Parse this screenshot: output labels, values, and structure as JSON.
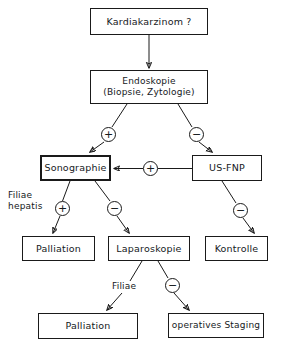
{
  "diagram": {
    "language": "de",
    "stroke_color": "#1a1a1a",
    "background_color": "#ffffff",
    "nodes": [
      {
        "id": "kardiakarzinom",
        "label": "Kardiakarzinom ?",
        "lines": [
          "Kardiakarzinom ?"
        ],
        "x": 90,
        "y": 8,
        "w": 118,
        "h": 27,
        "font_size": 9.5,
        "emphasis": "normal"
      },
      {
        "id": "endoskopie",
        "label": "Endoskopie (Biopsie, Zytologie)",
        "lines": [
          "Endoskopie",
          "(Biopsie, Zytologie)"
        ],
        "x": 90,
        "y": 70,
        "w": 118,
        "h": 34,
        "font_size": 9,
        "emphasis": "normal"
      },
      {
        "id": "sonographie",
        "label": "Sonographie",
        "lines": [
          "Sonographie"
        ],
        "x": 40,
        "y": 155,
        "w": 71,
        "h": 26,
        "font_size": 9.5,
        "emphasis": "thick"
      },
      {
        "id": "usfnp",
        "label": "US-FNP",
        "lines": [
          "US-FNP"
        ],
        "x": 192,
        "y": 155,
        "w": 70,
        "h": 26,
        "font_size": 9.5,
        "emphasis": "normal"
      },
      {
        "id": "palliation_1",
        "label": "Palliation",
        "lines": [
          "Palliation"
        ],
        "x": 22,
        "y": 236,
        "w": 73,
        "h": 25,
        "font_size": 9.5,
        "emphasis": "normal"
      },
      {
        "id": "laparoskopie",
        "label": "Laparoskopie",
        "lines": [
          "Laparoskopie"
        ],
        "x": 108,
        "y": 236,
        "w": 82,
        "h": 25,
        "font_size": 9.5,
        "emphasis": "normal"
      },
      {
        "id": "kontrolle",
        "label": "Kontrolle",
        "lines": [
          "Kontrolle"
        ],
        "x": 205,
        "y": 236,
        "w": 63,
        "h": 25,
        "font_size": 9.5,
        "emphasis": "normal"
      },
      {
        "id": "palliation_2",
        "label": "Palliation",
        "lines": [
          "Palliation"
        ],
        "x": 38,
        "y": 313,
        "w": 100,
        "h": 26,
        "font_size": 9.5,
        "emphasis": "normal"
      },
      {
        "id": "operatives_staging",
        "label": "operatives Staging",
        "lines": [
          "operatives Staging"
        ],
        "x": 168,
        "y": 313,
        "w": 96,
        "h": 25,
        "font_size": 9,
        "emphasis": "normal"
      }
    ],
    "sign_badges": [
      {
        "id": "badge_endo_pos",
        "sign": "+",
        "x": 101,
        "y": 127,
        "edge": "endoskopie-to-sonographie"
      },
      {
        "id": "badge_endo_neg",
        "sign": "−",
        "x": 189,
        "y": 127,
        "edge": "endoskopie-to-us-fnp"
      },
      {
        "id": "badge_usfnp_pos",
        "sign": "+",
        "x": 143,
        "y": 161,
        "edge": "us-fnp-to-sonographie"
      },
      {
        "id": "badge_sono_pos",
        "sign": "+",
        "x": 55,
        "y": 201,
        "edge": "sonographie-to-palliation"
      },
      {
        "id": "badge_sono_neg",
        "sign": "−",
        "x": 107,
        "y": 201,
        "edge": "sonographie-to-laparoskopie"
      },
      {
        "id": "badge_usfnp_neg",
        "sign": "−",
        "x": 233,
        "y": 203,
        "edge": "us-fnp-to-kontrolle"
      },
      {
        "id": "badge_lap_neg",
        "sign": "−",
        "x": 165,
        "y": 278,
        "edge": "laparoskopie-to-operatives-staging"
      }
    ],
    "edge_labels": [
      {
        "id": "label_filiae_hepatis",
        "lines": [
          "Filiae",
          "hepatis"
        ],
        "x": 8,
        "y": 190,
        "font_size": 9,
        "edge": "sonographie-to-palliation"
      },
      {
        "id": "label_filiae",
        "lines": [
          "Filiae"
        ],
        "x": 112,
        "y": 281,
        "font_size": 9,
        "edge": "laparoskopie-to-palliation"
      }
    ],
    "edges": [
      {
        "id": "kardiakarzinom-to-endoskopie",
        "from": "kardiakarzinom",
        "to": "endoskopie",
        "arrow": true
      },
      {
        "id": "endoskopie-to-sonographie",
        "from": "endoskopie",
        "to": "sonographie",
        "arrow": true,
        "sign": "+"
      },
      {
        "id": "endoskopie-to-us-fnp",
        "from": "endoskopie",
        "to": "usfnp",
        "arrow": true,
        "sign": "−"
      },
      {
        "id": "us-fnp-to-sonographie",
        "from": "usfnp",
        "to": "sonographie",
        "arrow": true,
        "sign": "+"
      },
      {
        "id": "sonographie-to-palliation",
        "from": "sonographie",
        "to": "palliation_1",
        "arrow": true,
        "sign": "+",
        "label": "Filiae hepatis"
      },
      {
        "id": "sonographie-to-laparoskopie",
        "from": "sonographie",
        "to": "laparoskopie",
        "arrow": true,
        "sign": "−"
      },
      {
        "id": "us-fnp-to-kontrolle",
        "from": "usfnp",
        "to": "kontrolle",
        "arrow": true,
        "sign": "−"
      },
      {
        "id": "laparoskopie-to-palliation",
        "from": "laparoskopie",
        "to": "palliation_2",
        "arrow": true,
        "label": "Filiae"
      },
      {
        "id": "laparoskopie-to-operatives-staging",
        "from": "laparoskopie",
        "to": "operatives_staging",
        "arrow": true,
        "sign": "−"
      }
    ]
  }
}
